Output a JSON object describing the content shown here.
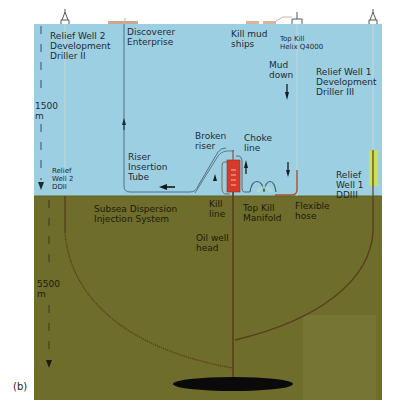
{
  "figure": {
    "panel_label": "(b)",
    "colors": {
      "water": "#9dcfe2",
      "seabed": "#6e6d2b",
      "seabed_light": "#787634",
      "bop": "#d63a2a",
      "reservoir": "#0a0a0a",
      "yellow_marker": "#d6e23a"
    }
  },
  "depth_axis": {
    "water_depth": "1500\nm",
    "well_depth": "5500\nm"
  },
  "surface": {
    "relief_well_2": "Relief Well 2\nDevelopment\nDriller II",
    "discoverer": "Discoverer\nEnterprise",
    "kill_mud_ships": "Kill mud\nships",
    "top_kill_vessel": "Top Kill\nHelix Q4000",
    "mud_down": "Mud\ndown",
    "relief_well_1": "Relief Well 1\nDevelopment\nDriller III"
  },
  "subsea": {
    "broken_riser": "Broken\nriser",
    "choke_line": "Choke\nline",
    "riser_insertion_tube": "Riser\nInsertion\nTube",
    "relief_well_2_short": "Relief\nWell 2\nDDII",
    "relief_well_1_short": "Relief\nWell 1\nDDIII",
    "kill_line": "Kill\nline",
    "top_kill_manifold": "Top Kill\nManifold",
    "flexible_hose": "Flexible\nhose",
    "subsea_dispersion": "Subsea Dispersion\nInjection System",
    "oil_well_head": "Oil well\nhead"
  }
}
